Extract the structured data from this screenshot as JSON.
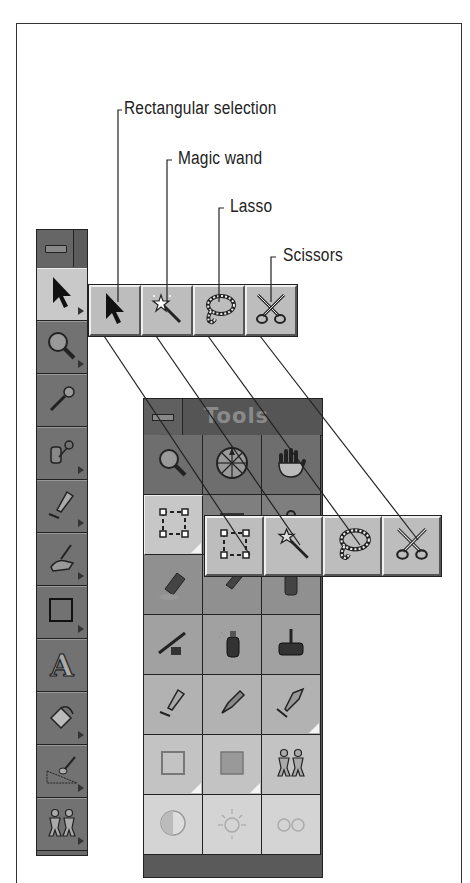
{
  "callouts": [
    {
      "label": "Rectangular selection"
    },
    {
      "label": "Magic wand"
    },
    {
      "label": "Lasso"
    },
    {
      "label": "Scissors"
    }
  ],
  "left_palette": {
    "close_icon": "close-box-icon",
    "tools": [
      {
        "name": "selection-arrow",
        "icon": "arrow-pointer-icon",
        "active": true,
        "has_flyout": true
      },
      {
        "name": "magnifier",
        "icon": "magnifier-icon",
        "active": false,
        "has_flyout": true
      },
      {
        "name": "eyedropper",
        "icon": "eyedropper-icon",
        "active": false,
        "has_flyout": false
      },
      {
        "name": "clone",
        "icon": "clone-bottle-icon",
        "active": false,
        "has_flyout": true
      },
      {
        "name": "brush",
        "icon": "brush-icon",
        "active": false,
        "has_flyout": true
      },
      {
        "name": "smudge",
        "icon": "smudge-hand-icon",
        "active": false,
        "has_flyout": true
      },
      {
        "name": "rectangle-shape",
        "icon": "rectangle-icon",
        "active": false,
        "has_flyout": true
      },
      {
        "name": "text",
        "icon": "letter-a-icon",
        "active": false,
        "has_flyout": false
      },
      {
        "name": "paint-bucket",
        "icon": "paint-bucket-icon",
        "active": false,
        "has_flyout": true
      },
      {
        "name": "effects",
        "icon": "effect-brush-icon",
        "active": false,
        "has_flyout": true
      },
      {
        "name": "object-picker",
        "icon": "paper-dolls-icon",
        "active": false,
        "has_flyout": true
      }
    ]
  },
  "upper_flyout": {
    "buttons": [
      {
        "name": "rectangular-selection",
        "icon": "arrow-pointer-icon"
      },
      {
        "name": "magic-wand",
        "icon": "magic-wand-icon"
      },
      {
        "name": "lasso",
        "icon": "lasso-icon"
      },
      {
        "name": "scissors",
        "icon": "scissors-icon"
      }
    ]
  },
  "tools_palette": {
    "title": "Tools",
    "close_icon": "close-box-icon",
    "cells": [
      {
        "name": "magnifier",
        "icon": "magnifier-icon",
        "active": false
      },
      {
        "name": "navigator",
        "icon": "compass-dial-icon",
        "active": false
      },
      {
        "name": "pan",
        "icon": "hand-icon",
        "active": false
      },
      {
        "name": "rectangular-selection",
        "icon": "dashed-rect-select-icon",
        "active": true
      },
      {
        "name": "shape",
        "icon": "shape-icon",
        "active": false
      },
      {
        "name": "retouch",
        "icon": "retouch-icon",
        "active": false
      },
      {
        "name": "eraser",
        "icon": "eraser-icon",
        "active": false
      },
      {
        "name": "smear",
        "icon": "smear-icon",
        "active": false
      },
      {
        "name": "bottle",
        "icon": "bottle-icon",
        "active": false
      },
      {
        "name": "airbrush",
        "icon": "airbrush-icon",
        "active": false
      },
      {
        "name": "spray-can",
        "icon": "spray-can-icon",
        "active": false
      },
      {
        "name": "roller",
        "icon": "paint-roller-icon",
        "active": false
      },
      {
        "name": "brush",
        "icon": "brush-icon",
        "active": false
      },
      {
        "name": "pen",
        "icon": "pen-nib-icon",
        "active": false
      },
      {
        "name": "calligraphy",
        "icon": "calligraphy-icon",
        "active": false
      },
      {
        "name": "rectangle-outline",
        "icon": "rectangle-outline-icon",
        "active": false
      },
      {
        "name": "rectangle-filled",
        "icon": "rectangle-filled-icon",
        "active": false
      },
      {
        "name": "objects",
        "icon": "paper-dolls-icon",
        "active": false
      },
      {
        "name": "contrast",
        "icon": "half-circle-icon",
        "active": false
      },
      {
        "name": "brightness",
        "icon": "sun-icon",
        "active": false
      },
      {
        "name": "red-eye",
        "icon": "eyes-icon",
        "active": false
      }
    ]
  },
  "lower_flyout": {
    "buttons": [
      {
        "name": "rectangular-selection",
        "icon": "dashed-rect-select-icon"
      },
      {
        "name": "magic-wand",
        "icon": "magic-wand-icon"
      },
      {
        "name": "lasso",
        "icon": "lasso-icon"
      },
      {
        "name": "scissors",
        "icon": "scissors-icon"
      }
    ]
  }
}
